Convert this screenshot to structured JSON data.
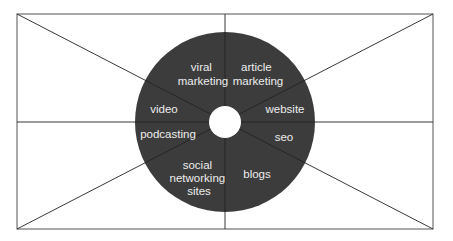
{
  "diagram": {
    "title": "",
    "colors": {
      "background": "#ffffff",
      "frame_stroke": "#555555",
      "disc_fill": "#3c3c3c",
      "hub_fill": "#ffffff",
      "label_text": "#ececec"
    },
    "frame": {
      "x": 17,
      "y": 14,
      "width": 416,
      "height": 215
    },
    "disc": {
      "cx": 225,
      "cy": 122,
      "r": 90,
      "hub_r": 16
    },
    "segments": [
      {
        "id": "viral-marketing",
        "lines": [
          "viral",
          "marketing"
        ]
      },
      {
        "id": "article-marketing",
        "lines": [
          "article",
          "marketing"
        ]
      },
      {
        "id": "website",
        "lines": [
          "website"
        ]
      },
      {
        "id": "seo",
        "lines": [
          "seo"
        ]
      },
      {
        "id": "blogs",
        "lines": [
          "blogs"
        ]
      },
      {
        "id": "social-networking-sites",
        "lines": [
          "social",
          "networking",
          "sites"
        ]
      },
      {
        "id": "podcasting",
        "lines": [
          "podcasting"
        ]
      },
      {
        "id": "video",
        "lines": [
          "video"
        ]
      }
    ]
  }
}
